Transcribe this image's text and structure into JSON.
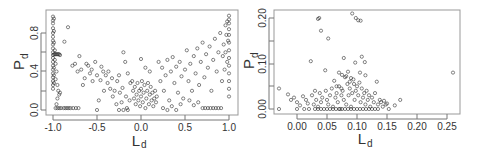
{
  "chart_data": [
    {
      "type": "scatter",
      "title": "",
      "xlabel": "L_d",
      "ylabel": "P_d",
      "xlim": [
        -1.05,
        1.05
      ],
      "ylim": [
        -0.05,
        1.0
      ],
      "xticks": [
        -1.0,
        -0.5,
        0.0,
        0.5,
        1.0
      ],
      "xtick_labels": [
        "-1.0",
        "-0.5",
        "0.0",
        "0.5",
        "1.0"
      ],
      "yticks": [
        0.0,
        0.2,
        0.4,
        0.6,
        0.8
      ],
      "ytick_labels": [
        "0.0",
        "",
        "0.4",
        "",
        "0.8"
      ],
      "grid": false,
      "legend": null,
      "marker": "open-circle",
      "description": "Dense vertical band at L_d=-1.0 spanning P_d 0–0.98, dense cluster near L_d=0 with P_d 0–0.3, rising cloud toward L_d=1.0 reaching P_d≈0.98, horizontal band of points at P_d≈0.02",
      "points": [
        [
          -1.0,
          0.97
        ],
        [
          -1.0,
          0.93
        ],
        [
          -1.0,
          0.9
        ],
        [
          -1.0,
          0.85
        ],
        [
          -1.0,
          0.8
        ],
        [
          -1.0,
          0.76
        ],
        [
          -1.0,
          0.72
        ],
        [
          -1.0,
          0.68
        ],
        [
          -1.0,
          0.64
        ],
        [
          -1.0,
          0.6
        ],
        [
          -1.0,
          0.57
        ],
        [
          -1.0,
          0.54
        ],
        [
          -1.0,
          0.5
        ],
        [
          -1.0,
          0.46
        ],
        [
          -1.0,
          0.42
        ],
        [
          -1.0,
          0.38
        ],
        [
          -1.0,
          0.34
        ],
        [
          -1.0,
          0.3
        ],
        [
          -1.0,
          0.26
        ],
        [
          -1.0,
          0.22
        ],
        [
          -0.99,
          0.95
        ],
        [
          -0.99,
          0.82
        ],
        [
          -0.99,
          0.7
        ],
        [
          -0.99,
          0.58
        ],
        [
          -0.99,
          0.44
        ],
        [
          -0.99,
          0.36
        ],
        [
          -0.99,
          0.28
        ],
        [
          -0.98,
          0.62
        ],
        [
          -0.98,
          0.58
        ],
        [
          -0.97,
          0.58
        ],
        [
          -0.96,
          0.58
        ],
        [
          -0.95,
          0.58
        ],
        [
          -0.94,
          0.58
        ],
        [
          -0.93,
          0.58
        ],
        [
          -0.92,
          0.57
        ],
        [
          -0.98,
          0.52
        ],
        [
          -0.97,
          0.48
        ],
        [
          -0.96,
          0.4
        ],
        [
          -0.97,
          0.32
        ],
        [
          -0.95,
          0.26
        ],
        [
          -0.94,
          0.2
        ],
        [
          -0.93,
          0.16
        ],
        [
          -0.92,
          0.18
        ],
        [
          -0.95,
          0.12
        ],
        [
          -0.96,
          0.06
        ],
        [
          -0.97,
          0.02
        ],
        [
          -0.95,
          0.02
        ],
        [
          -0.93,
          0.02
        ],
        [
          -0.91,
          0.02
        ],
        [
          -0.88,
          0.02
        ],
        [
          -0.86,
          0.02
        ],
        [
          -0.84,
          0.02
        ],
        [
          -0.82,
          0.02
        ],
        [
          -0.8,
          0.02
        ],
        [
          -0.77,
          0.02
        ],
        [
          -0.74,
          0.02
        ],
        [
          -0.71,
          0.02
        ],
        [
          -0.83,
          0.86
        ],
        [
          -0.87,
          0.71
        ],
        [
          -0.78,
          0.46
        ],
        [
          -0.75,
          0.48
        ],
        [
          -0.72,
          0.4
        ],
        [
          -0.7,
          0.56
        ],
        [
          -0.68,
          0.42
        ],
        [
          -0.66,
          0.26
        ],
        [
          -0.64,
          0.33
        ],
        [
          -0.62,
          0.48
        ],
        [
          -0.6,
          0.46
        ],
        [
          -0.58,
          0.38
        ],
        [
          -0.56,
          0.42
        ],
        [
          -0.55,
          0.3
        ],
        [
          -0.52,
          0.5
        ],
        [
          -0.5,
          0.36
        ],
        [
          -0.48,
          0.1
        ],
        [
          -0.46,
          0.31
        ],
        [
          -0.45,
          0.45
        ],
        [
          -0.43,
          0.4
        ],
        [
          -0.42,
          0.2
        ],
        [
          -0.4,
          0.36
        ],
        [
          -0.38,
          0.28
        ],
        [
          -0.37,
          0.4
        ],
        [
          -0.35,
          0.22
        ],
        [
          -0.33,
          0.33
        ],
        [
          -0.32,
          0.14
        ],
        [
          -0.3,
          0.2
        ],
        [
          -0.28,
          0.06
        ],
        [
          -0.27,
          0.3
        ],
        [
          -0.25,
          0.36
        ],
        [
          -0.24,
          0.18
        ],
        [
          -0.22,
          0.08
        ],
        [
          -0.21,
          0.23
        ],
        [
          -0.2,
          0.6
        ],
        [
          -0.18,
          0.5
        ],
        [
          -0.17,
          0.14
        ],
        [
          -0.16,
          0.02
        ],
        [
          -0.15,
          0.38
        ],
        [
          -0.13,
          0.1
        ],
        [
          -0.12,
          0.28
        ],
        [
          -0.5,
          0.0
        ],
        [
          -0.1,
          0.3
        ],
        [
          -0.09,
          0.2
        ],
        [
          -0.08,
          0.12
        ],
        [
          -0.07,
          0.24
        ],
        [
          -0.06,
          0.06
        ],
        [
          -0.05,
          0.16
        ],
        [
          -0.04,
          0.28
        ],
        [
          -0.03,
          0.1
        ],
        [
          -0.02,
          0.2
        ],
        [
          -0.01,
          0.04
        ],
        [
          0.0,
          0.14
        ],
        [
          0.0,
          0.22
        ],
        [
          0.01,
          0.3
        ],
        [
          0.02,
          0.08
        ],
        [
          0.03,
          0.18
        ],
        [
          0.04,
          0.26
        ],
        [
          0.05,
          0.02
        ],
        [
          0.06,
          0.12
        ],
        [
          0.07,
          0.2
        ],
        [
          0.08,
          0.28
        ],
        [
          0.09,
          0.06
        ],
        [
          0.1,
          0.16
        ],
        [
          0.11,
          0.24
        ],
        [
          0.12,
          0.1
        ],
        [
          0.13,
          0.18
        ],
        [
          0.14,
          0.04
        ],
        [
          0.15,
          0.12
        ],
        [
          0.16,
          0.2
        ],
        [
          0.17,
          0.08
        ],
        [
          0.18,
          0.14
        ],
        [
          0.0,
          0.53
        ],
        [
          0.05,
          0.44
        ],
        [
          0.1,
          0.4
        ],
        [
          0.2,
          0.5
        ],
        [
          0.22,
          0.3
        ],
        [
          0.24,
          0.44
        ],
        [
          0.26,
          0.2
        ],
        [
          0.28,
          0.36
        ],
        [
          0.3,
          0.52
        ],
        [
          0.32,
          0.1
        ],
        [
          0.34,
          0.4
        ],
        [
          0.36,
          0.55
        ],
        [
          0.38,
          0.28
        ],
        [
          0.4,
          0.45
        ],
        [
          0.42,
          0.18
        ],
        [
          0.44,
          0.5
        ],
        [
          0.46,
          0.35
        ],
        [
          0.48,
          0.12
        ],
        [
          0.5,
          0.42
        ],
        [
          0.52,
          0.62
        ],
        [
          0.54,
          0.3
        ],
        [
          0.56,
          0.48
        ],
        [
          0.58,
          0.2
        ],
        [
          0.6,
          0.56
        ],
        [
          0.62,
          0.38
        ],
        [
          0.64,
          0.64
        ],
        [
          0.66,
          0.26
        ],
        [
          0.68,
          0.5
        ],
        [
          0.7,
          0.7
        ],
        [
          0.72,
          0.34
        ],
        [
          0.74,
          0.58
        ],
        [
          0.76,
          0.44
        ],
        [
          0.78,
          0.66
        ],
        [
          0.8,
          0.2
        ],
        [
          0.82,
          0.52
        ],
        [
          0.84,
          0.74
        ],
        [
          0.86,
          0.4
        ],
        [
          0.88,
          0.6
        ],
        [
          0.9,
          0.8
        ],
        [
          0.92,
          0.3
        ],
        [
          0.94,
          0.68
        ],
        [
          0.96,
          0.88
        ],
        [
          0.98,
          0.5
        ],
        [
          0.99,
          0.72
        ],
        [
          1.0,
          0.98
        ],
        [
          1.0,
          0.94
        ],
        [
          1.0,
          0.9
        ],
        [
          1.0,
          0.84
        ],
        [
          1.0,
          0.78
        ],
        [
          1.0,
          0.7
        ],
        [
          1.0,
          0.62
        ],
        [
          1.0,
          0.54
        ],
        [
          1.0,
          0.46
        ],
        [
          1.0,
          0.38
        ],
        [
          1.0,
          0.3
        ],
        [
          1.0,
          0.22
        ],
        [
          1.0,
          0.14
        ],
        [
          0.98,
          0.92
        ],
        [
          0.97,
          0.78
        ],
        [
          0.96,
          0.6
        ],
        [
          0.95,
          0.42
        ],
        [
          0.93,
          0.56
        ],
        [
          0.7,
          0.02
        ],
        [
          0.73,
          0.02
        ],
        [
          0.76,
          0.02
        ],
        [
          0.79,
          0.02
        ],
        [
          0.82,
          0.02
        ],
        [
          0.85,
          0.02
        ],
        [
          0.88,
          0.02
        ],
        [
          0.91,
          0.02
        ],
        [
          0.6,
          0.05
        ],
        [
          0.65,
          0.08
        ],
        [
          0.55,
          0.1
        ],
        [
          0.45,
          0.06
        ],
        [
          0.35,
          0.04
        ],
        [
          0.25,
          0.02
        ],
        [
          -0.25,
          0.0
        ],
        [
          -0.2,
          0.0
        ],
        [
          -0.15,
          0.0
        ],
        [
          0.3,
          0.0
        ],
        [
          0.4,
          0.0
        ]
      ]
    },
    {
      "type": "scatter",
      "title": "",
      "xlabel": "L_d",
      "ylabel": "P_d",
      "xlim": [
        -0.04,
        0.27
      ],
      "ylim": [
        -0.01,
        0.21
      ],
      "xticks": [
        0.0,
        0.05,
        0.1,
        0.15,
        0.2,
        0.25
      ],
      "xtick_labels": [
        "0.00",
        "0.05",
        "0.10",
        "0.15",
        "0.20",
        "0.25"
      ],
      "yticks": [
        0.0,
        0.05,
        0.1,
        0.15,
        0.2
      ],
      "ytick_labels": [
        "0.00",
        "",
        "0.10",
        "",
        "0.20"
      ],
      "grid": false,
      "legend": null,
      "marker": "open-circle",
      "description": "Dense cluster at L_d 0.02–0.15 with P_d 0–0.05, sparse outliers up to P_d≈0.21 and one point at L_d≈0.26, P_d≈0.08",
      "points": [
        [
          -0.03,
          0.0
        ],
        [
          -0.03,
          0.045
        ],
        [
          -0.015,
          0.032
        ],
        [
          -0.01,
          0.02
        ],
        [
          -0.005,
          0.025
        ],
        [
          0.0,
          0.0
        ],
        [
          0.0,
          0.015
        ],
        [
          0.005,
          0.008
        ],
        [
          0.01,
          0.028
        ],
        [
          0.012,
          0.0
        ],
        [
          0.015,
          0.02
        ],
        [
          0.018,
          0.012
        ],
        [
          0.02,
          0.0
        ],
        [
          0.023,
          0.105
        ],
        [
          0.035,
          0.198
        ],
        [
          0.037,
          0.2
        ],
        [
          0.04,
          0.172
        ],
        [
          0.047,
          0.085
        ],
        [
          0.052,
          0.155
        ],
        [
          0.078,
          0.112
        ],
        [
          0.092,
          0.21
        ],
        [
          0.098,
          0.2
        ],
        [
          0.102,
          0.195
        ],
        [
          0.106,
          0.194
        ],
        [
          0.108,
          0.115
        ],
        [
          0.113,
          0.103
        ],
        [
          0.097,
          0.102
        ],
        [
          0.105,
          0.08
        ],
        [
          0.114,
          0.074
        ],
        [
          0.26,
          0.08
        ],
        [
          0.025,
          0.03
        ],
        [
          0.028,
          0.01
        ],
        [
          0.03,
          0.04
        ],
        [
          0.032,
          0.02
        ],
        [
          0.035,
          0.005
        ],
        [
          0.038,
          0.035
        ],
        [
          0.04,
          0.015
        ],
        [
          0.042,
          0.025
        ],
        [
          0.045,
          0.0
        ],
        [
          0.048,
          0.04
        ],
        [
          0.05,
          0.02
        ],
        [
          0.052,
          0.01
        ],
        [
          0.055,
          0.03
        ],
        [
          0.058,
          0.045
        ],
        [
          0.06,
          0.005
        ],
        [
          0.062,
          0.062
        ],
        [
          0.064,
          0.025
        ],
        [
          0.066,
          0.035
        ],
        [
          0.068,
          0.015
        ],
        [
          0.07,
          0.05
        ],
        [
          0.072,
          0.0
        ],
        [
          0.074,
          0.03
        ],
        [
          0.076,
          0.04
        ],
        [
          0.078,
          0.02
        ],
        [
          0.08,
          0.07
        ],
        [
          0.082,
          0.01
        ],
        [
          0.084,
          0.055
        ],
        [
          0.086,
          0.03
        ],
        [
          0.088,
          0.045
        ],
        [
          0.09,
          0.005
        ],
        [
          0.092,
          0.035
        ],
        [
          0.094,
          0.065
        ],
        [
          0.096,
          0.02
        ],
        [
          0.098,
          0.04
        ],
        [
          0.1,
          0.0
        ],
        [
          0.102,
          0.03
        ],
        [
          0.104,
          0.058
        ],
        [
          0.106,
          0.015
        ],
        [
          0.108,
          0.045
        ],
        [
          0.11,
          0.025
        ],
        [
          0.112,
          0.035
        ],
        [
          0.114,
          0.01
        ],
        [
          0.116,
          0.04
        ],
        [
          0.118,
          0.02
        ],
        [
          0.12,
          0.03
        ],
        [
          0.122,
          0.005
        ],
        [
          0.125,
          0.025
        ],
        [
          0.128,
          0.015
        ],
        [
          0.13,
          0.035
        ],
        [
          0.133,
          0.06
        ],
        [
          0.135,
          0.01
        ],
        [
          0.138,
          0.02
        ],
        [
          0.14,
          0.015
        ],
        [
          0.143,
          0.005
        ],
        [
          0.145,
          0.018
        ],
        [
          0.148,
          0.01
        ],
        [
          0.15,
          0.012
        ],
        [
          0.153,
          0.0
        ],
        [
          0.163,
          0.008
        ],
        [
          0.172,
          0.02
        ],
        [
          0.06,
          0.0
        ],
        [
          0.065,
          0.0
        ],
        [
          0.07,
          0.0
        ],
        [
          0.075,
          0.0
        ],
        [
          0.08,
          0.0
        ],
        [
          0.085,
          0.0
        ],
        [
          0.09,
          0.0
        ],
        [
          0.095,
          0.0
        ],
        [
          0.105,
          0.0
        ],
        [
          0.11,
          0.0
        ],
        [
          0.115,
          0.0
        ],
        [
          0.12,
          0.0
        ],
        [
          0.125,
          0.0
        ],
        [
          0.13,
          0.0
        ],
        [
          0.135,
          0.0
        ],
        [
          0.055,
          0.0
        ],
        [
          0.05,
          0.0
        ],
        [
          0.04,
          0.0
        ],
        [
          0.035,
          0.0
        ],
        [
          0.03,
          0.0
        ],
        [
          0.07,
          0.08
        ],
        [
          0.075,
          0.075
        ],
        [
          0.085,
          0.082
        ],
        [
          0.09,
          0.068
        ],
        [
          0.082,
          0.072
        ],
        [
          0.088,
          0.06
        ],
        [
          0.095,
          0.055
        ],
        [
          0.1,
          0.05
        ],
        [
          0.074,
          0.045
        ],
        [
          0.066,
          0.05
        ]
      ]
    }
  ],
  "plots": [
    {
      "ylabel_main": "P",
      "ylabel_sub": "d",
      "xlabel_main": "L",
      "xlabel_sub": "d",
      "xtick_labels": [
        "-1.0",
        "-0.5",
        "0.0",
        "0.5",
        "1.0"
      ],
      "ytick_labels": [
        "0.0",
        "0.4",
        "0.8"
      ]
    },
    {
      "ylabel_main": "P",
      "ylabel_sub": "d",
      "xlabel_main": "L",
      "xlabel_sub": "d",
      "xtick_labels": [
        "0.00",
        "0.05",
        "0.10",
        "0.15",
        "0.20",
        "0.25"
      ],
      "ytick_labels": [
        "0.00",
        "0.10",
        "0.20"
      ]
    }
  ],
  "colors": {
    "axis": "#999999",
    "marker": "#333333",
    "text": "#333333"
  }
}
